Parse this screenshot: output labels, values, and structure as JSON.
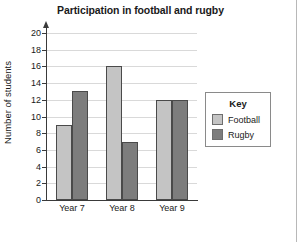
{
  "chart_data": {
    "type": "bar",
    "title": "Participation in football and rugby",
    "xlabel": "",
    "ylabel": "Number of students",
    "categories": [
      "Year 7",
      "Year 8",
      "Year 9"
    ],
    "series": [
      {
        "name": "Football",
        "values": [
          9,
          16,
          12
        ],
        "color": "#c4c4c4"
      },
      {
        "name": "Rugby",
        "values": [
          13,
          7,
          12
        ],
        "color": "#7d7d7d"
      }
    ],
    "ylim": [
      0,
      20
    ],
    "ytick_step": 2,
    "yticks": [
      0,
      2,
      4,
      6,
      8,
      10,
      12,
      14,
      16,
      18,
      20
    ],
    "ytick_labels": [
      "0",
      "2",
      "4",
      "6",
      "8",
      "10",
      "12",
      "14",
      "16",
      "18",
      "20"
    ],
    "grid": true,
    "grid_axis": "y",
    "legend_position": "right",
    "legend_title": "Key"
  },
  "legend": {
    "title": "Key",
    "entries": [
      {
        "label": "Football"
      },
      {
        "label": "Rugby"
      }
    ]
  }
}
